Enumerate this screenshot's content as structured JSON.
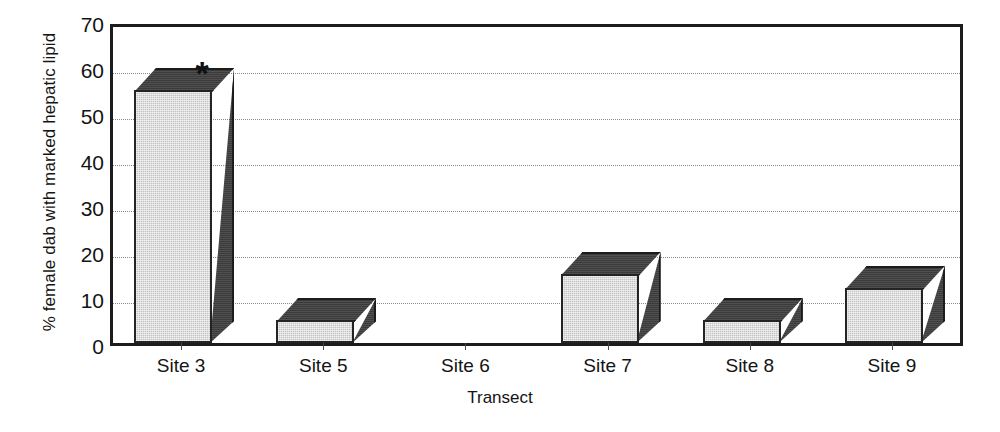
{
  "chart_data": {
    "type": "bar",
    "title": "",
    "subtitle": "",
    "xlabel": "Transect",
    "ylabel": "% female dab with marked hepatic lipid",
    "categories": [
      "Site 3",
      "Site 5",
      "Site 6",
      "Site 7",
      "Site 8",
      "Site 9"
    ],
    "values": [
      55,
      5,
      0,
      15,
      5,
      12
    ],
    "series": [
      {
        "name": "% female dab with marked hepatic lipid",
        "values": [
          55,
          5,
          0,
          15,
          5,
          12
        ]
      }
    ],
    "ylim": [
      0,
      70
    ],
    "y_major_ticks": [
      0,
      10,
      20,
      30,
      40,
      50,
      60,
      70
    ],
    "y_minor_ticks": [
      5,
      15,
      25,
      35,
      45,
      55,
      65
    ],
    "y_tick_labels": [
      "0",
      "10",
      "20",
      "30",
      "40",
      "50",
      "60",
      "70"
    ],
    "grid": "horizontal-dotted",
    "legend": "none",
    "style": "3d-bar",
    "annotations": [
      {
        "text": "*",
        "category": "Site 3",
        "value": 60,
        "meaning": "significance-marker"
      }
    ],
    "colors": {
      "bar_front": "#c3c3c3",
      "bar_side": "#3b3b3b",
      "bar_top": "#3b3b3b",
      "axis": "#1c1c1c",
      "gridline": "#8a8a8a",
      "text": "#141414",
      "background": "#ffffff"
    }
  }
}
